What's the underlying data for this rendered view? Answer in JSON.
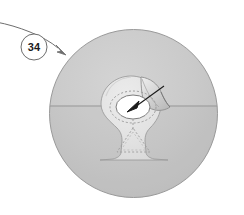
{
  "figure": {
    "background_color": "#ffffff",
    "canvas": {
      "width": 244,
      "height": 215
    }
  },
  "callout": {
    "label": "34",
    "shape": "circle",
    "center": {
      "x": 34,
      "y": 47
    },
    "radius": 13,
    "stroke_color": "#6e6e6e",
    "text_color": "#1b1b1b",
    "leader": {
      "name": "leader-line",
      "from": {
        "x": 0,
        "y": 23
      },
      "to": {
        "x": 66,
        "y": 53
      },
      "arrowhead": true,
      "stroke_color": "#6e6e6e"
    }
  },
  "disc": {
    "name": "outer-disc",
    "center": {
      "x": 133.5,
      "y": 113.5
    },
    "radius": 84,
    "fill_upper": "#c9c9c9",
    "fill_lower": "#c3c3c3",
    "stroke_color": "#8a8a8a",
    "split_line_y": 106,
    "split_line_color": "#8f8f8f"
  },
  "keyhole": {
    "name": "keyhole-region",
    "fill": "#e4e4e4",
    "stroke_color": "#9a9a9a",
    "head_center": {
      "x": 131,
      "y": 106
    },
    "head_radius": 30,
    "base_top_y": 133,
    "base_bottom_y": 160,
    "base_left_x": 100,
    "base_right_x": 168
  },
  "flap": {
    "name": "peeled-flap",
    "fill": "#d2d2d2",
    "stroke_color": "#8d8d8d",
    "description": "lifted corner at upper right of keyhole"
  },
  "aperture": {
    "name": "inner-ellipse",
    "center": {
      "x": 133,
      "y": 107
    },
    "rx": 17,
    "ry": 12,
    "fill": "#ffffff",
    "stroke_color": "#7d7d7d",
    "dashed_ring": {
      "rx": 23,
      "ry": 16,
      "stroke_color": "#9c9c9c",
      "dash": "2 2"
    }
  },
  "triangle": {
    "name": "dashed-triangle",
    "apex": {
      "x": 133,
      "y": 128
    },
    "left": {
      "x": 117,
      "y": 152
    },
    "right": {
      "x": 150,
      "y": 152
    },
    "stroke_color": "#a2a2a2",
    "dash": "2 2",
    "stem_from": {
      "x": 133,
      "y": 119
    },
    "stem_to": {
      "x": 133,
      "y": 128
    }
  },
  "pointer": {
    "name": "pointer-arrow",
    "from": {
      "x": 163,
      "y": 87
    },
    "to": {
      "x": 129,
      "y": 110
    },
    "color": "#1b1b1b"
  }
}
